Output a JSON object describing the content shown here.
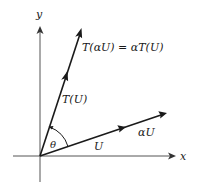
{
  "diagram": {
    "axes": {
      "x_label": "x",
      "y_label": "y"
    },
    "vectors": [
      {
        "name": "U",
        "label": "U"
      },
      {
        "name": "alpha-U",
        "label": "αU"
      },
      {
        "name": "T-of-U",
        "label": "T(U)"
      },
      {
        "name": "T-of-alpha-U",
        "label": "T(αU) = αT(U)"
      }
    ],
    "angle": {
      "label": "θ"
    },
    "colors": {
      "stroke": "#1a1a1a",
      "background": "#ffffff"
    }
  }
}
